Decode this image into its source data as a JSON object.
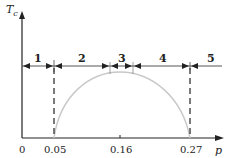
{
  "diagram": {
    "y_axis": {
      "label": "T",
      "label_sub": "c"
    },
    "x_axis": {
      "label": "p",
      "ticks": [
        {
          "value": "0",
          "x": 22
        },
        {
          "value": "0.05",
          "x": 54
        },
        {
          "value": "0.16",
          "x": 120
        },
        {
          "value": "0.27",
          "x": 190
        }
      ]
    },
    "regions": [
      {
        "id": "1",
        "label": "1",
        "x": 37
      },
      {
        "id": "2",
        "label": "2",
        "x": 81
      },
      {
        "id": "3",
        "label": "3",
        "x": 121
      },
      {
        "id": "4",
        "label": "4",
        "x": 162
      },
      {
        "id": "5",
        "label": "5",
        "x": 210
      }
    ],
    "boundaries_x": [
      54,
      110,
      133,
      190
    ],
    "dome": {
      "start_p": "0.05",
      "peak_p": "0.16",
      "end_p": "0.27"
    },
    "colors": {
      "axis": "#222222",
      "dome": "#c8c8c8",
      "dash": "#333333"
    }
  }
}
